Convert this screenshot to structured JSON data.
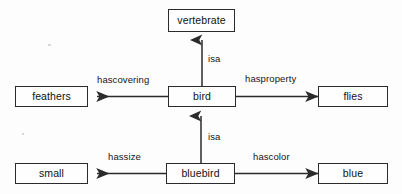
{
  "diagram": {
    "type": "semantic-network",
    "title": "",
    "background_color": "#fdfdfd",
    "line_color": "#2b2b2b",
    "text_color": "#111111",
    "nodes": [
      {
        "id": "vertebrate",
        "label": "vertebrate",
        "x": 168,
        "y": 9,
        "w": 67,
        "h": 23
      },
      {
        "id": "bird",
        "label": "bird",
        "x": 168,
        "y": 86,
        "w": 68,
        "h": 21
      },
      {
        "id": "bluebird",
        "label": "bluebird",
        "x": 166,
        "y": 163,
        "w": 69,
        "h": 21
      },
      {
        "id": "feathers",
        "label": "feathers",
        "x": 15,
        "y": 86,
        "w": 73,
        "h": 21
      },
      {
        "id": "small",
        "label": "small",
        "x": 15,
        "y": 163,
        "w": 73,
        "h": 21
      },
      {
        "id": "flies",
        "label": "flies",
        "x": 318,
        "y": 86,
        "w": 70,
        "h": 21
      },
      {
        "id": "blue",
        "label": "blue",
        "x": 318,
        "y": 163,
        "w": 70,
        "h": 21
      }
    ],
    "edges": [
      {
        "id": "bird-isa-vertebrate",
        "label": "isa",
        "from": "bird",
        "to": "vertebrate",
        "direction": "up",
        "label_x": 208,
        "label_y": 54
      },
      {
        "id": "bluebird-isa-bird",
        "label": "isa",
        "from": "bluebird",
        "to": "bird",
        "direction": "up",
        "label_x": 208,
        "label_y": 132
      },
      {
        "id": "bird-hascovering",
        "label": "hascovering",
        "from": "bird",
        "to": "feathers",
        "direction": "left",
        "label_x": 97,
        "label_y": 75
      },
      {
        "id": "bird-hasproperty",
        "label": "hasproperty",
        "from": "bird",
        "to": "flies",
        "direction": "right",
        "label_x": 245,
        "label_y": 74
      },
      {
        "id": "bluebird-hassize",
        "label": "hassize",
        "from": "bluebird",
        "to": "small",
        "direction": "left",
        "label_x": 108,
        "label_y": 152
      },
      {
        "id": "bluebird-hascolor",
        "label": "hascolor",
        "from": "bluebird",
        "to": "blue",
        "direction": "right",
        "label_x": 253,
        "label_y": 152
      }
    ]
  }
}
